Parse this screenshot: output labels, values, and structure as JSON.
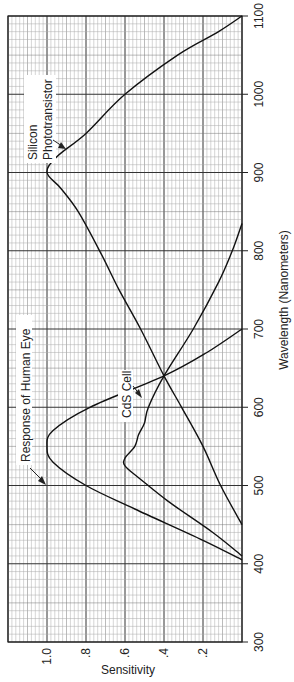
{
  "chart_data": {
    "type": "line",
    "title": "",
    "orientation": "rotated 90deg (wavelength on vertical axis, sensitivity on horizontal axis)",
    "xlabel": "Wavelength (Nanometers)",
    "ylabel": "Sensitivity",
    "xlim": [
      300,
      1100
    ],
    "ylim": [
      0,
      1.2
    ],
    "x_ticks": [
      "300",
      "400",
      "500",
      "600",
      "700",
      "800",
      "900",
      "1000",
      "1100"
    ],
    "y_ticks": [
      ".2",
      ".4",
      ".6",
      ".8",
      "1.0"
    ],
    "grid": true,
    "series": [
      {
        "name": "Response of Human Eye",
        "x": [
          405,
          430,
          470,
          500,
          530,
          550,
          570,
          600,
          640,
          670,
          700
        ],
        "values": [
          0.0,
          0.2,
          0.55,
          0.8,
          0.97,
          1.0,
          0.97,
          0.78,
          0.4,
          0.18,
          0.0
        ]
      },
      {
        "name": "CdS Cell",
        "x": [
          410,
          440,
          480,
          510,
          525,
          535,
          550,
          565,
          580,
          600,
          640,
          700,
          760,
          800,
          835
        ],
        "values": [
          0.0,
          0.15,
          0.38,
          0.53,
          0.6,
          0.6,
          0.55,
          0.53,
          0.5,
          0.48,
          0.4,
          0.25,
          0.12,
          0.05,
          0.0
        ]
      },
      {
        "name": "Silicon Phototransistor",
        "x": [
          450,
          500,
          550,
          600,
          640,
          700,
          750,
          800,
          850,
          880,
          900,
          920,
          950,
          1000,
          1050,
          1080,
          1100
        ],
        "values": [
          0.0,
          0.11,
          0.2,
          0.31,
          0.4,
          0.52,
          0.63,
          0.73,
          0.84,
          0.93,
          1.0,
          0.95,
          0.8,
          0.6,
          0.33,
          0.12,
          0.0
        ]
      }
    ],
    "annotations": [
      "Response of Human Eye",
      "CdS Cell",
      "Silicon Phototransistor"
    ]
  },
  "labels": {
    "xlabel": "Wavelength (Nanometers)",
    "ylabel": "Sensitivity",
    "eye": "Response of Human Eye",
    "cds": "CdS Cell",
    "silicon_1": "Silicon",
    "silicon_2": "Phototransistor"
  }
}
